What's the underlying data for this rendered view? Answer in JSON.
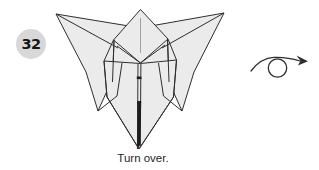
{
  "step_badge": {
    "number": "32"
  },
  "caption": {
    "text": "Turn over."
  },
  "figure": {
    "label": "origami-model"
  },
  "icons": {
    "turn_over": "turn-over-icon"
  },
  "colors": {
    "background": "#ffffff",
    "paper_fill": "#ebebeb",
    "outline": "#2e2e2e",
    "crease_light": "#9a9a9a",
    "slit_dark": "#1c1c1c",
    "badge_background": "#d8d8d8",
    "badge_text": "#161616"
  }
}
